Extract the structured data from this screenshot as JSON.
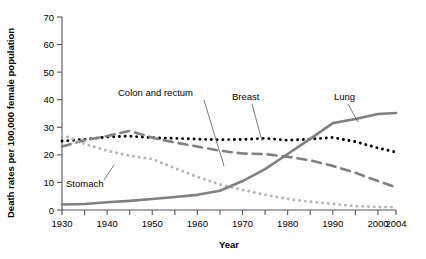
{
  "chart_data": {
    "type": "line",
    "title": "",
    "xlabel": "Year",
    "ylabel": "Death rates per 100,000 female population",
    "xlim": [
      1930,
      2004
    ],
    "ylim": [
      0,
      70
    ],
    "grid": false,
    "legend_position": "inline-annotations",
    "x_tick_labels": [
      "1930",
      "1940",
      "1950",
      "1960",
      "1970",
      "1980",
      "1990",
      "2000",
      "2004"
    ],
    "x_tick_values": [
      1930,
      1940,
      1950,
      1960,
      1970,
      1980,
      1990,
      2000,
      2004
    ],
    "x_minor_tick_values": [
      1935,
      1945,
      1955,
      1965,
      1975,
      1985,
      1995
    ],
    "y_tick_labels": [
      "0",
      "10",
      "20",
      "30",
      "40",
      "50",
      "60",
      "70"
    ],
    "y_tick_values": [
      0,
      10,
      20,
      30,
      40,
      50,
      60,
      70
    ],
    "x": [
      1930,
      1935,
      1940,
      1945,
      1950,
      1955,
      1960,
      1965,
      1970,
      1975,
      1980,
      1985,
      1990,
      1995,
      2000,
      2004
    ],
    "series": [
      {
        "name": "Breast",
        "style": "dotted",
        "color": "#000000",
        "values": [
          25.0,
          25.6,
          26.5,
          26.8,
          26.2,
          26.0,
          25.7,
          25.5,
          25.6,
          26.0,
          25.3,
          25.7,
          26.3,
          24.8,
          22.5,
          21.0
        ]
      },
      {
        "name": "Colon and rectum",
        "style": "dashed",
        "color": "#808080",
        "values": [
          23.0,
          25.3,
          26.8,
          28.7,
          26.2,
          24.5,
          23.0,
          21.5,
          20.5,
          20.3,
          19.3,
          18.0,
          16.0,
          13.5,
          10.5,
          8.2
        ]
      },
      {
        "name": "Stomach",
        "style": "dotted",
        "color": "#b5b5b5",
        "values": [
          27.3,
          24.0,
          21.5,
          19.7,
          18.5,
          15.2,
          12.0,
          9.3,
          7.3,
          5.5,
          4.0,
          3.0,
          2.2,
          1.4,
          1.1,
          1.0
        ]
      },
      {
        "name": "Lung",
        "style": "solid",
        "color": "#808080",
        "values": [
          2.0,
          2.2,
          2.8,
          3.3,
          4.0,
          4.7,
          5.5,
          7.0,
          10.5,
          14.8,
          20.3,
          25.8,
          31.5,
          33.0,
          34.8,
          35.2
        ]
      }
    ],
    "annotations": [
      {
        "label": "Colon and rectum",
        "text_x": 118,
        "text_y": 96,
        "leader": [
          [
            204,
            100
          ],
          [
            224,
            166
          ]
        ]
      },
      {
        "label": "Breast",
        "text_x": 232,
        "text_y": 100,
        "leader": [
          [
            252,
            104
          ],
          [
            262,
            141
          ]
        ]
      },
      {
        "label": "Lung",
        "text_x": 334,
        "text_y": 100,
        "leader": [
          [
            348,
            104
          ],
          [
            358,
            122
          ]
        ]
      },
      {
        "label": "Stomach",
        "text_x": 66,
        "text_y": 187,
        "leader": [
          [
            104,
            180
          ],
          [
            114,
            165
          ]
        ]
      }
    ]
  }
}
